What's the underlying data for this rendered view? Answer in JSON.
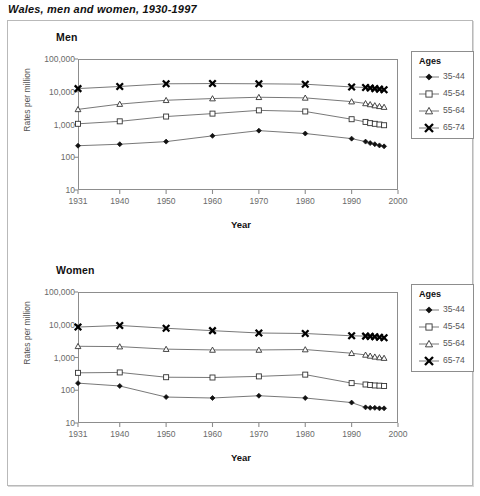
{
  "figure": {
    "title": "Wales, men and women, 1930-1997"
  },
  "axes": {
    "ylabel": "Rates per million",
    "xlabel": "Year",
    "yticks": [
      "100,000",
      "10,000",
      "1,000",
      "100",
      "10"
    ],
    "xticks": [
      "1931",
      "1940",
      "1950",
      "1960",
      "1970",
      "1980",
      "1990",
      "2000"
    ]
  },
  "legend": {
    "title": "Ages",
    "entries": [
      {
        "label": "35-44",
        "marker": "filled-diamond-icon"
      },
      {
        "label": "45-54",
        "marker": "open-square-icon"
      },
      {
        "label": "55-64",
        "marker": "open-triangle-icon"
      },
      {
        "label": "65-74",
        "marker": "cross-x-icon"
      }
    ]
  },
  "panels": [
    {
      "id": "men",
      "title": "Men"
    },
    {
      "id": "women",
      "title": "Women"
    }
  ],
  "chart_data": [
    {
      "type": "line",
      "title": "Men",
      "xlabel": "Year",
      "ylabel": "Rates per million",
      "yscale": "log",
      "ylim": [
        10,
        100000
      ],
      "xlim": [
        1931,
        2000
      ],
      "grid": false,
      "legend_position": "right",
      "legend_title": "Ages",
      "x": [
        1931,
        1940,
        1950,
        1960,
        1970,
        1980,
        1990,
        1993,
        1994,
        1995,
        1996,
        1997
      ],
      "series": [
        {
          "name": "35-44",
          "marker": "filled-diamond",
          "values": [
            225,
            250,
            300,
            450,
            650,
            530,
            370,
            300,
            270,
            250,
            230,
            215
          ]
        },
        {
          "name": "45-54",
          "marker": "open-square",
          "values": [
            1050,
            1250,
            1750,
            2150,
            2700,
            2500,
            1450,
            1200,
            1100,
            1050,
            1000,
            950
          ]
        },
        {
          "name": "55-64",
          "marker": "open-triangle",
          "values": [
            2900,
            4200,
            5500,
            6200,
            6800,
            6500,
            5000,
            4400,
            4100,
            3800,
            3600,
            3400
          ]
        },
        {
          "name": "65-74",
          "marker": "cross-x",
          "values": [
            12500,
            14500,
            17500,
            17800,
            17500,
            17000,
            14000,
            13500,
            13000,
            12500,
            12000,
            11500
          ]
        }
      ]
    },
    {
      "type": "line",
      "title": "Women",
      "xlabel": "Year",
      "ylabel": "Rates per million",
      "yscale": "log",
      "ylim": [
        10,
        100000
      ],
      "xlim": [
        1931,
        2000
      ],
      "grid": false,
      "legend_position": "right",
      "legend_title": "Ages",
      "x": [
        1931,
        1940,
        1950,
        1960,
        1970,
        1980,
        1990,
        1993,
        1994,
        1995,
        1996,
        1997
      ],
      "series": [
        {
          "name": "35-44",
          "marker": "filled-diamond",
          "values": [
            165,
            135,
            62,
            58,
            68,
            58,
            42,
            30,
            29,
            29,
            28,
            28
          ]
        },
        {
          "name": "45-54",
          "marker": "open-square",
          "values": [
            340,
            350,
            250,
            245,
            265,
            300,
            165,
            150,
            145,
            140,
            138,
            135
          ]
        },
        {
          "name": "55-64",
          "marker": "open-triangle",
          "values": [
            2200,
            2150,
            1800,
            1700,
            1700,
            1750,
            1350,
            1200,
            1120,
            1050,
            1000,
            960
          ]
        },
        {
          "name": "65-74",
          "marker": "cross-x",
          "values": [
            8500,
            9500,
            7800,
            6600,
            5600,
            5400,
            4600,
            4500,
            4400,
            4300,
            4150,
            4000
          ]
        }
      ]
    }
  ]
}
